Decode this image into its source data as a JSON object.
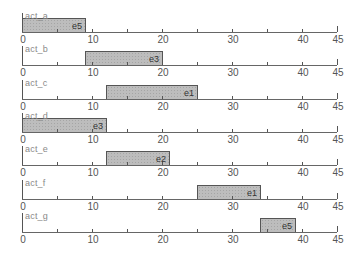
{
  "chart_data": {
    "type": "bar",
    "subtype": "gantt-small-multiples",
    "title": "",
    "xlabel": "",
    "ylabel": "",
    "xlim": [
      0,
      45
    ],
    "x_ticks": [
      0,
      10,
      20,
      30,
      40,
      45
    ],
    "minor_ticks": [
      5,
      15,
      25,
      35
    ],
    "grid": false,
    "legend": null,
    "fill_color": "#bdbdbd",
    "border_color": "#555555",
    "rows": [
      {
        "activity": "act_a",
        "start": 0,
        "end": 9,
        "label": "e5"
      },
      {
        "activity": "act_b",
        "start": 9,
        "end": 20,
        "label": "e3"
      },
      {
        "activity": "act_c",
        "start": 12,
        "end": 25,
        "label": "e1"
      },
      {
        "activity": "act_d",
        "start": 0,
        "end": 12,
        "label": "e3"
      },
      {
        "activity": "act_e",
        "start": 12,
        "end": 21,
        "label": "e2"
      },
      {
        "activity": "act_f",
        "start": 25,
        "end": 34,
        "label": "e1"
      },
      {
        "activity": "act_g",
        "start": 34,
        "end": 39,
        "label": "e5"
      }
    ]
  },
  "layout": {
    "x0_px": 22,
    "px_per_unit": 7,
    "first_axis_y": 32,
    "row_spacing": 33.3,
    "bar_height": 15
  }
}
